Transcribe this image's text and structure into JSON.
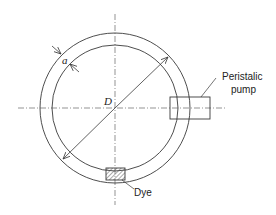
{
  "diagram": {
    "type": "schematic",
    "labels": {
      "thickness": "a",
      "diameter": "D",
      "pump_line1": "Peristalic",
      "pump_line2": "pump",
      "dye": "Dye"
    },
    "colors": {
      "line": "#3a3a3a",
      "centerline": "#555555",
      "background": "#ffffff",
      "hatch": "#555555"
    },
    "geometry": {
      "center": [
        115,
        108
      ],
      "outer_radius": 75,
      "inner_radius": 63
    }
  }
}
